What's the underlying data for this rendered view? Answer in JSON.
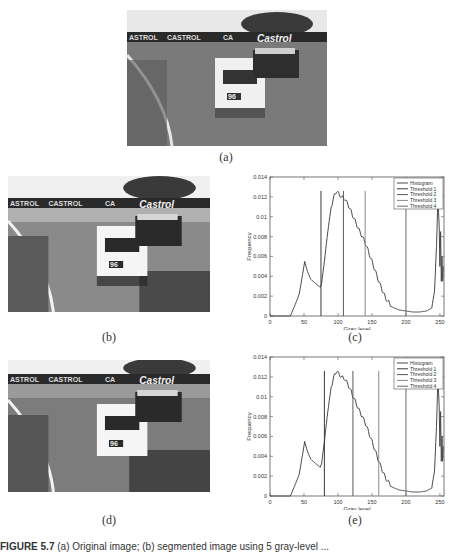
{
  "figure": {
    "labels": {
      "a": "(a)",
      "b": "(b)",
      "c": "(c)",
      "d": "(d)",
      "e": "(e)"
    },
    "caption_prefix": "FIGURE 5.7",
    "caption_text": "(a) Original image; (b) segmented image using 5 gray-level ..."
  },
  "photos": {
    "a": {
      "desc": "Original race car image",
      "sign_texts": [
        "ASTROL",
        "CASTROL",
        "CA",
        "Castrol"
      ],
      "car_number": "96"
    },
    "b": {
      "desc": "Segmented image (thresholds set 1)",
      "sign_texts": [
        "ASTROL",
        "CASTROL",
        "CA",
        "Castrol"
      ],
      "car_number": "96"
    },
    "d": {
      "desc": "Segmented image (thresholds set 2)",
      "sign_texts": [
        "ASTROL",
        "CASTROL",
        "CA",
        "Castrol"
      ],
      "car_number": "96"
    }
  },
  "chart_data": [
    {
      "id": "c",
      "type": "line",
      "title": "",
      "xlabel": "Gray level",
      "ylabel": "Frequency",
      "xlim": [
        0,
        256
      ],
      "ylim": [
        0,
        0.014
      ],
      "xticks": [
        0,
        50,
        100,
        150,
        200,
        250
      ],
      "yticks": [
        0,
        0.002,
        0.004,
        0.006,
        0.008,
        0.01,
        0.012,
        0.014
      ],
      "ytick_labels": [
        "0",
        "0.002",
        "0.004",
        "0.006",
        "0.008",
        "0.01",
        "0.012",
        "0.014"
      ],
      "legend": [
        "Histogram",
        "Threshold 1",
        "Threshold 2",
        "Threshold 3",
        "Threshold 4"
      ],
      "legend_position": "upper right",
      "grid": false,
      "histogram": {
        "x": [
          0,
          30,
          33,
          38,
          43,
          48,
          51,
          55,
          60,
          65,
          70,
          74,
          76,
          80,
          85,
          90,
          95,
          98,
          100,
          105,
          110,
          115,
          120,
          130,
          140,
          150,
          160,
          170,
          180,
          190,
          200,
          210,
          220,
          230,
          238,
          242,
          245,
          247,
          249,
          250,
          251,
          252,
          253,
          254,
          255
        ],
        "y": [
          0,
          0,
          0.0005,
          0.0013,
          0.0022,
          0.0042,
          0.0055,
          0.0045,
          0.0037,
          0.0034,
          0.0031,
          0.0029,
          0.0033,
          0.0055,
          0.0085,
          0.011,
          0.0122,
          0.0126,
          0.0124,
          0.012,
          0.0118,
          0.0112,
          0.0104,
          0.0088,
          0.0074,
          0.0055,
          0.0035,
          0.0018,
          0.0009,
          0.0006,
          0.0005,
          0.0004,
          0.0004,
          0.0005,
          0.0008,
          0.0025,
          0.007,
          0.0118,
          0.009,
          0.005,
          0.0085,
          0.0035,
          0.006,
          0.0035,
          0.005
        ]
      },
      "thresholds": [
        75,
        108,
        140,
        200
      ],
      "threshold_colors": [
        "#3a3a3a",
        "#5a5a5a",
        "#8a8a8a",
        "#6a6a6a"
      ],
      "histogram_color": "#4a4a4a"
    },
    {
      "id": "e",
      "type": "line",
      "title": "",
      "xlabel": "Gray level",
      "ylabel": "Frequency",
      "xlim": [
        0,
        256
      ],
      "ylim": [
        0,
        0.014
      ],
      "xticks": [
        0,
        50,
        100,
        150,
        200,
        250
      ],
      "yticks": [
        0,
        0.002,
        0.004,
        0.006,
        0.008,
        0.01,
        0.012,
        0.014
      ],
      "ytick_labels": [
        "0",
        "0.002",
        "0.004",
        "0.006",
        "0.008",
        "0.01",
        "0.012",
        "0.014"
      ],
      "legend": [
        "Histogram",
        "Threshold 1",
        "Threshold 2",
        "Threshold 3",
        "Threshold 4"
      ],
      "legend_position": "upper right",
      "grid": false,
      "histogram": {
        "x": [
          0,
          30,
          33,
          38,
          43,
          48,
          51,
          55,
          60,
          65,
          70,
          74,
          76,
          80,
          85,
          90,
          95,
          98,
          100,
          105,
          110,
          115,
          120,
          130,
          140,
          150,
          160,
          170,
          180,
          190,
          200,
          210,
          220,
          230,
          238,
          242,
          245,
          247,
          249,
          250,
          251,
          252,
          253,
          254,
          255
        ],
        "y": [
          0,
          0,
          0.0005,
          0.0013,
          0.0022,
          0.0042,
          0.0055,
          0.0045,
          0.0037,
          0.0034,
          0.0031,
          0.0029,
          0.0033,
          0.0055,
          0.0085,
          0.011,
          0.0122,
          0.0126,
          0.0124,
          0.012,
          0.0118,
          0.0112,
          0.0104,
          0.0088,
          0.0074,
          0.0055,
          0.0035,
          0.0018,
          0.0009,
          0.0006,
          0.0005,
          0.0004,
          0.0004,
          0.0005,
          0.0008,
          0.0025,
          0.007,
          0.0118,
          0.009,
          0.005,
          0.0085,
          0.0035,
          0.006,
          0.0035,
          0.005
        ]
      },
      "thresholds": [
        80,
        122,
        160,
        200
      ],
      "threshold_colors": [
        "#3a3a3a",
        "#5a5a5a",
        "#8a8a8a",
        "#6a6a6a"
      ],
      "histogram_color": "#4a4a4a"
    }
  ]
}
